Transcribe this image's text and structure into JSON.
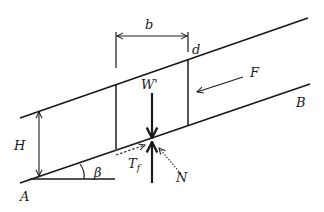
{
  "diagram": {
    "type": "infinite-slope-slice-free-body",
    "colors": {
      "line": "#1a1a1a",
      "background": "#ffffff"
    },
    "labels": {
      "b": "b",
      "d": "d",
      "W": "W'",
      "F": "F",
      "B": "B",
      "H": "H",
      "beta": "β",
      "T_main": "T",
      "T_sub": "f",
      "N": "N",
      "A": "A"
    },
    "elements": {
      "ground_surface": "upper slope surface line",
      "slip_plane": "lower parallel slip plane line A–B",
      "slice": "vertical slice of width b",
      "weight": "downward arrow W'",
      "reaction": "upward reaction arrow",
      "shear_force": "dashed arrow T_f along slip plane",
      "normal_force": "dotted arrow N toward slip plane",
      "side_force": "arrow F parallel to slope",
      "depth": "dimension H between surfaces",
      "angle": "slope angle β at A"
    }
  }
}
